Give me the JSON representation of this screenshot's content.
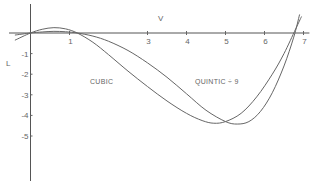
{
  "chart_data": {
    "type": "line",
    "title": "",
    "xlabel": "V",
    "ylabel": "L",
    "xlim": [
      -0.5,
      7.1
    ],
    "ylim": [
      -7,
      1.5
    ],
    "x_ticks": [
      1,
      3,
      4,
      5,
      6,
      7
    ],
    "x_tick_labels": [
      "1",
      "3",
      "4",
      "5",
      "6",
      "7"
    ],
    "y_ticks": [
      -1,
      -2,
      -3,
      -4,
      -5
    ],
    "y_tick_labels": [
      "-1",
      "-2",
      "-3",
      "-4",
      "-5"
    ],
    "grid": false,
    "annotations": [
      {
        "text": "CUBIC",
        "x": 2.0,
        "y": -2.0
      },
      {
        "text": "QUINTIC  ÷ 9",
        "x": 4.0,
        "y": -2.0
      }
    ],
    "series": [
      {
        "name": "CUBIC",
        "x": [
          -0.4,
          0,
          0.3,
          0.6,
          0.9,
          1.2,
          1.6,
          2.0,
          2.5,
          3.0,
          3.5,
          4.0,
          4.4,
          4.7,
          5.0,
          5.4,
          5.8,
          6.2,
          6.5,
          6.8,
          6.95
        ],
        "y": [
          -0.35,
          0,
          0.18,
          0.26,
          0.2,
          0.0,
          -0.45,
          -1.05,
          -1.85,
          -2.6,
          -3.3,
          -3.9,
          -4.25,
          -4.38,
          -4.3,
          -3.9,
          -3.1,
          -2.0,
          -1.0,
          0.2,
          0.8
        ]
      },
      {
        "name": "QUINTIC ÷ 9",
        "x": [
          -0.4,
          0,
          0.3,
          0.6,
          0.9,
          1.2,
          1.6,
          2.0,
          2.5,
          3.0,
          3.5,
          4.0,
          4.5,
          5.0,
          5.3,
          5.6,
          5.9,
          6.2,
          6.5,
          6.75,
          6.9
        ],
        "y": [
          -0.1,
          0,
          0.05,
          0.08,
          0.06,
          0.0,
          -0.15,
          -0.4,
          -0.85,
          -1.45,
          -2.15,
          -2.95,
          -3.75,
          -4.3,
          -4.42,
          -4.3,
          -3.8,
          -2.9,
          -1.6,
          -0.2,
          0.9
        ]
      }
    ]
  }
}
